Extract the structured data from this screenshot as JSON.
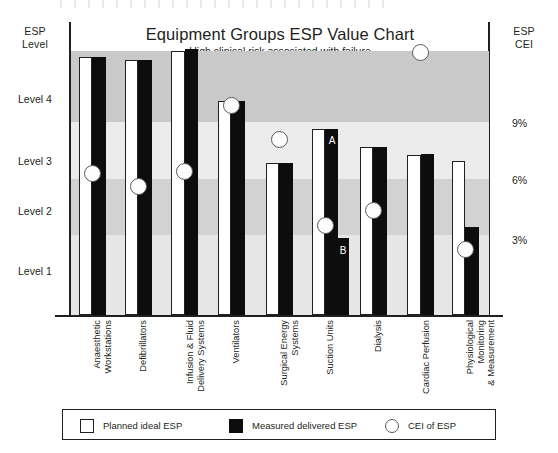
{
  "chart_data": {
    "type": "bar",
    "title": "Equipment Groups ESP Value Chart",
    "subtitle": "High clinical risk associated with failure",
    "left_axis": {
      "label_line1": "ESP",
      "label_line2": "Level",
      "ticks": [
        "Level 4",
        "Level 3",
        "Level 2",
        "Level 1"
      ],
      "tick_values": [
        4,
        3,
        2,
        1
      ]
    },
    "right_axis": {
      "label_line1": "ESP",
      "label_line2": "CEI",
      "ticks": [
        "9%",
        "6%",
        "3%"
      ],
      "tick_values": [
        9,
        6,
        3
      ]
    },
    "categories": [
      "Anaesthetic Workstations",
      "Defibrillators",
      "Infusion & Fluid Delivery Systems",
      "Ventilators",
      "Surgical Energy Systems",
      "Suction Units",
      "Dialysis",
      "Cardiac Perfusion",
      "Physiological Monitoring & Measurement"
    ],
    "category_lines": [
      [
        "Anaesthetic",
        "Workstations"
      ],
      [
        "Defibrillators"
      ],
      [
        "Infusion & Fluid",
        "Delivery Systems"
      ],
      [
        "Ventilators"
      ],
      [
        "Surgical Energy",
        "Systems"
      ],
      [
        "Suction Units"
      ],
      [
        "Dialysis"
      ],
      [
        "Cardiac Perfusion"
      ],
      [
        "Physiological",
        "Monitoring",
        "& Measurement"
      ]
    ],
    "series": [
      {
        "name": "Planned ideal ESP",
        "key": "planned",
        "values": [
          4.15,
          4.1,
          4.25,
          3.45,
          2.45,
          3.0,
          2.7,
          2.58,
          2.48
        ]
      },
      {
        "name": "Measured delivered ESP",
        "key": "measured",
        "values": [
          4.15,
          4.1,
          4.28,
          3.45,
          2.45,
          3.0,
          2.7,
          2.6,
          1.42
        ]
      },
      {
        "name": "CEI of ESP",
        "key": "cei",
        "values": [
          5.8,
          5.3,
          5.9,
          8.6,
          7.2,
          3.7,
          4.3,
          10.8,
          2.7
        ]
      }
    ],
    "annotations": [
      {
        "text": "A",
        "category": "Suction Units",
        "note": "upper measured segment"
      },
      {
        "text": "B",
        "category": "Suction Units",
        "note": "lower measured segment"
      }
    ],
    "legend": {
      "position": "bottom",
      "entries": [
        {
          "label": "Planned ideal ESP",
          "swatch": "open-square"
        },
        {
          "label": "Measured delivered ESP",
          "swatch": "filled-square"
        },
        {
          "label": "CEI of ESP",
          "swatch": "open-circle"
        }
      ]
    },
    "bands": [
      {
        "color": "#c9c9c9",
        "top_pct": 9.9,
        "height_pct": 24.2
      },
      {
        "color": "#ececec",
        "top_pct": 34.1,
        "height_pct": 19.5
      },
      {
        "color": "#d2d2d2",
        "top_pct": 53.6,
        "height_pct": 19.1
      },
      {
        "color": "#e6e6e6",
        "top_pct": 72.7,
        "height_pct": 27.3
      }
    ],
    "grid": false
  }
}
